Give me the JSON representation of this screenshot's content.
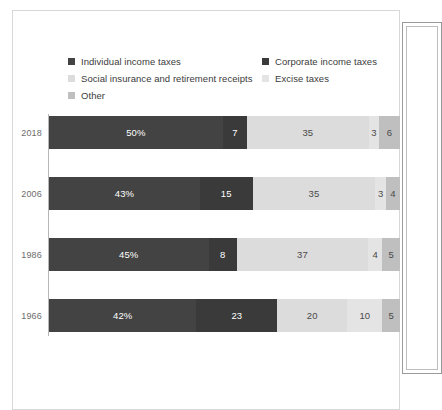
{
  "chart_data": {
    "type": "bar",
    "orientation": "horizontal",
    "stacked": true,
    "stack_mode": "percent",
    "title": "",
    "subtitle": "",
    "xlabel": "",
    "ylabel": "",
    "xlim": [
      0,
      100
    ],
    "grid": false,
    "legend_position": "top",
    "categories": [
      "2018",
      "2006",
      "1986",
      "1966"
    ],
    "series": [
      {
        "name": "Individual income taxes",
        "color": "#434343",
        "values": [
          50,
          43,
          45,
          42
        ],
        "labels": [
          "50%",
          "43%",
          "45%",
          "42%"
        ]
      },
      {
        "name": "Corporate income taxes",
        "color": "#3a3a3a",
        "values": [
          7,
          15,
          8,
          23
        ],
        "labels": [
          "7",
          "15",
          "8",
          "23"
        ]
      },
      {
        "name": "Social insurance and retirement receipts",
        "color": "#dcdcdc",
        "values": [
          35,
          35,
          37,
          20
        ],
        "labels": [
          "35",
          "35",
          "37",
          "20"
        ]
      },
      {
        "name": "Excise taxes",
        "color": "#e4e4e4",
        "values": [
          3,
          3,
          4,
          10
        ],
        "labels": [
          "3",
          "3",
          "4",
          "10"
        ]
      },
      {
        "name": "Other",
        "color": "#bfbfbf",
        "values": [
          6,
          4,
          5,
          5
        ],
        "labels": [
          "6",
          "4",
          "5",
          "5"
        ]
      }
    ]
  },
  "legend": {
    "items": [
      {
        "label": "Individual income taxes",
        "color": "#434343"
      },
      {
        "label": "Corporate income taxes",
        "color": "#3a3a3a"
      },
      {
        "label": "Social insurance and retirement receipts",
        "color": "#dcdcdc"
      },
      {
        "label": "Excise taxes",
        "color": "#e4e4e4"
      },
      {
        "label": "Other",
        "color": "#bfbfbf"
      }
    ]
  },
  "rows": [
    {
      "year": "2018",
      "segments": [
        {
          "label": "50%",
          "value": 50,
          "series": "Individual income taxes",
          "color": "#434343",
          "text": "#ffffff"
        },
        {
          "label": "7",
          "value": 7,
          "series": "Corporate income taxes",
          "color": "#3a3a3a",
          "text": "#ffffff"
        },
        {
          "label": "35",
          "value": 35,
          "series": "Social insurance and retirement receipts",
          "color": "#dcdcdc",
          "text": "#4a4a4a"
        },
        {
          "label": "3",
          "value": 3,
          "series": "Excise taxes",
          "color": "#e4e4e4",
          "text": "#4a4a4a"
        },
        {
          "label": "6",
          "value": 6,
          "series": "Other",
          "color": "#bfbfbf",
          "text": "#4a4a4a"
        }
      ]
    },
    {
      "year": "2006",
      "segments": [
        {
          "label": "43%",
          "value": 43,
          "series": "Individual income taxes",
          "color": "#434343",
          "text": "#ffffff"
        },
        {
          "label": "15",
          "value": 15,
          "series": "Corporate income taxes",
          "color": "#3a3a3a",
          "text": "#ffffff"
        },
        {
          "label": "35",
          "value": 35,
          "series": "Social insurance and retirement receipts",
          "color": "#dcdcdc",
          "text": "#4a4a4a"
        },
        {
          "label": "3",
          "value": 3,
          "series": "Excise taxes",
          "color": "#e4e4e4",
          "text": "#4a4a4a"
        },
        {
          "label": "4",
          "value": 4,
          "series": "Other",
          "color": "#bfbfbf",
          "text": "#4a4a4a"
        }
      ]
    },
    {
      "year": "1986",
      "segments": [
        {
          "label": "45%",
          "value": 45,
          "series": "Individual income taxes",
          "color": "#434343",
          "text": "#ffffff"
        },
        {
          "label": "8",
          "value": 8,
          "series": "Corporate income taxes",
          "color": "#3a3a3a",
          "text": "#ffffff"
        },
        {
          "label": "37",
          "value": 37,
          "series": "Social insurance and retirement receipts",
          "color": "#dcdcdc",
          "text": "#4a4a4a"
        },
        {
          "label": "4",
          "value": 4,
          "series": "Excise taxes",
          "color": "#e4e4e4",
          "text": "#4a4a4a"
        },
        {
          "label": "5",
          "value": 5,
          "series": "Other",
          "color": "#bfbfbf",
          "text": "#4a4a4a"
        }
      ]
    },
    {
      "year": "1966",
      "segments": [
        {
          "label": "42%",
          "value": 42,
          "series": "Individual income taxes",
          "color": "#434343",
          "text": "#ffffff"
        },
        {
          "label": "23",
          "value": 23,
          "series": "Corporate income taxes",
          "color": "#3a3a3a",
          "text": "#ffffff"
        },
        {
          "label": "20",
          "value": 20,
          "series": "Social insurance and retirement receipts",
          "color": "#dcdcdc",
          "text": "#4a4a4a"
        },
        {
          "label": "10",
          "value": 10,
          "series": "Excise taxes",
          "color": "#e4e4e4",
          "text": "#4a4a4a"
        },
        {
          "label": "5",
          "value": 5,
          "series": "Other",
          "color": "#bfbfbf",
          "text": "#4a4a4a"
        }
      ]
    }
  ],
  "colors": {
    "axis_line": "#b7b7b7",
    "frame_border": "#d8d8d8",
    "panel_border": "#9a9a9a",
    "year_label": "#6d6d6d",
    "legend_text": "#3b3b3b",
    "background": "#ffffff"
  }
}
